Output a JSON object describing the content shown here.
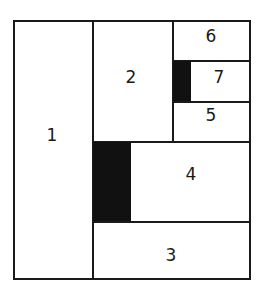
{
  "diagram": {
    "type": "rectangular-partition",
    "regions": [
      {
        "id": "1",
        "label": "1"
      },
      {
        "id": "2",
        "label": "2"
      },
      {
        "id": "3",
        "label": "3"
      },
      {
        "id": "4",
        "label": "4"
      },
      {
        "id": "5",
        "label": "5"
      },
      {
        "id": "6",
        "label": "6"
      },
      {
        "id": "7",
        "label": "7"
      }
    ],
    "shaded_blocks": [
      {
        "adjacent_to": "7",
        "color": "#111111"
      },
      {
        "adjacent_to": "4",
        "color": "#111111"
      }
    ],
    "colors": {
      "line": "#1a1a1a",
      "fill": "#111111",
      "background": "#ffffff"
    }
  }
}
